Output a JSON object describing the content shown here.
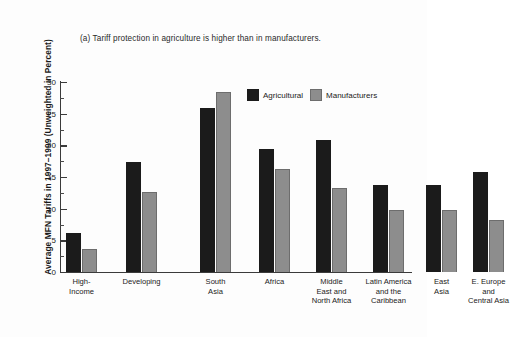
{
  "chart_data": {
    "type": "bar",
    "title": "(a) Tariff protection in agriculture is higher than in manufacturers.",
    "xlabel": "",
    "ylabel": "Average MFN Tariffs in 1997–1999 (Unweighted in Percent)",
    "ylim": [
      0,
      30
    ],
    "yticks": [
      0,
      5,
      10,
      15,
      20,
      25,
      30
    ],
    "ytick_labels": [
      "0",
      "5",
      "10",
      "15",
      "20",
      "25",
      "30"
    ],
    "minor_ticks": [
      2.5,
      7.5,
      12.5,
      17.5,
      22.5,
      27.5
    ],
    "grid": false,
    "legend_position": "upper right",
    "categories": [
      "High-\nIncome",
      "Developing",
      "South\nAsia",
      "Africa",
      "Middle\nEast and\nNorth Africa",
      "Latin America\nand the\nCaribbean",
      "East\nAsia",
      "E. Europe\nand\nCentral Asia"
    ],
    "category_labels": [
      [
        "High-",
        "Income"
      ],
      [
        "Developing"
      ],
      [
        "South",
        "Asia"
      ],
      [
        "Africa"
      ],
      [
        "Middle",
        "East and",
        "North Africa"
      ],
      [
        "Latin America",
        "and the",
        "Caribbean"
      ],
      [
        "East",
        "Asia"
      ],
      [
        "E. Europe",
        "and",
        "Central Asia"
      ]
    ],
    "series": [
      {
        "name": "Agricultural",
        "color": "#1b1b1b",
        "values": [
          6.2,
          17.4,
          25.9,
          19.5,
          20.9,
          13.8,
          13.8,
          15.8
        ]
      },
      {
        "name": "Manufacturers",
        "color": "#8d8d8d",
        "values": [
          3.6,
          12.6,
          28.4,
          16.2,
          13.3,
          9.8,
          9.8,
          8.2
        ]
      }
    ]
  },
  "legend": {
    "items": [
      {
        "label": "Agricultural",
        "color": "#1b1b1b"
      },
      {
        "label": "Manufacturers",
        "color": "#8d8d8d"
      }
    ]
  },
  "colors": {
    "agricultural": "#1b1b1b",
    "manufacturers": "#8d8d8d",
    "axis": "#3b3b3b",
    "background": "#fdfdfd"
  }
}
